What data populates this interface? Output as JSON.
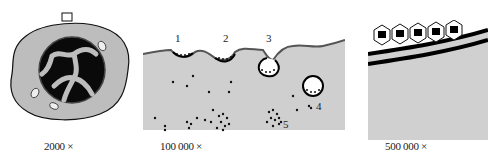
{
  "figure": {
    "panels": [
      {
        "id": "low-magnification-cell",
        "magnification_label": "2000 ×",
        "description": "Whole cell with nucleus; boxed region on the membrane"
      },
      {
        "id": "medium-magnification-membrane",
        "magnification_label": "100 000 ×",
        "callouts": [
          "1",
          "2",
          "3",
          "4",
          "5"
        ]
      },
      {
        "id": "high-magnification-membrane",
        "magnification_label": "500 000 ×",
        "description": "Lattice of hexagonal coat units over a double membrane"
      }
    ],
    "colors": {
      "cytoplasm": "#c8c8c8",
      "outline": "#111111",
      "nucleus": "#0a0a0a",
      "background": "#ffffff"
    }
  }
}
